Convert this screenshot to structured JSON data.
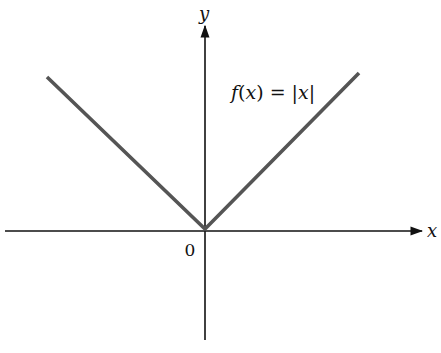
{
  "figure": {
    "function_label": "f(x) = |x|",
    "x_axis_label": "x",
    "y_axis_label": "y",
    "origin_label": "0"
  },
  "colors": {
    "axes": "#111111",
    "curve": "#555555",
    "background": "#ffffff"
  }
}
